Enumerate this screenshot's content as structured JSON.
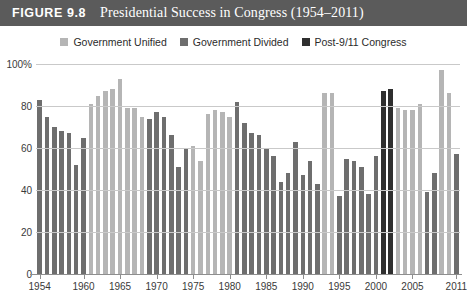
{
  "figure": {
    "number": "FIGURE 9.8",
    "title": "Presidential Success in Congress (1954–2011)"
  },
  "legend": {
    "position": "top-center",
    "items": [
      {
        "label": "Government Unified",
        "color": "#b5b5b5",
        "key": "unified"
      },
      {
        "label": "Government Divided",
        "color": "#6e6e6e",
        "key": "divided"
      },
      {
        "label": "Post-9/11 Congress",
        "color": "#2f2f2f",
        "key": "post911"
      }
    ]
  },
  "colors": {
    "title_bar": "#5b5b5b",
    "unified": "#b5b5b5",
    "divided": "#6e6e6e",
    "post911": "#2f2f2f",
    "gridline": "#c9c9c9",
    "axis": "#8e8e8e",
    "text": "#3a3a3a"
  },
  "chart_data": {
    "type": "bar",
    "title": "Presidential Success in Congress (1954–2011)",
    "xlabel": "",
    "ylabel": "",
    "ylim": [
      0,
      100
    ],
    "yticks": [
      0,
      20,
      40,
      60,
      80,
      100
    ],
    "ytick_labels": [
      "0",
      "20",
      "40",
      "60",
      "80",
      "100%"
    ],
    "xticks": [
      1954,
      1960,
      1965,
      1970,
      1975,
      1980,
      1985,
      1990,
      1995,
      2000,
      2005,
      2011
    ],
    "xtick_labels": [
      "1954",
      "1960",
      "1965",
      "1970",
      "1975",
      "1980",
      "1985",
      "1990",
      "1995",
      "2000",
      "2005",
      "2011"
    ],
    "grid": true,
    "series": [
      {
        "name": "Government Unified",
        "color": "#b5b5b5"
      },
      {
        "name": "Government Divided",
        "color": "#6e6e6e"
      },
      {
        "name": "Post-9/11 Congress",
        "color": "#2f2f2f"
      }
    ],
    "categories": [
      1954,
      1955,
      1956,
      1957,
      1958,
      1959,
      1960,
      1961,
      1962,
      1963,
      1964,
      1965,
      1966,
      1967,
      1968,
      1969,
      1970,
      1971,
      1972,
      1973,
      1974,
      1975,
      1976,
      1977,
      1978,
      1979,
      1980,
      1981,
      1982,
      1983,
      1984,
      1985,
      1986,
      1987,
      1988,
      1989,
      1990,
      1991,
      1992,
      1993,
      1994,
      1995,
      1996,
      1997,
      1998,
      1999,
      2000,
      2001,
      2002,
      2003,
      2004,
      2005,
      2006,
      2007,
      2008,
      2009,
      2010,
      2011
    ],
    "values": [
      83,
      75,
      70,
      68,
      67,
      52,
      65,
      81,
      85,
      87,
      88,
      93,
      79,
      79,
      75,
      74,
      77,
      75,
      66,
      51,
      60,
      61,
      54,
      76,
      78,
      77,
      75,
      82,
      72,
      67,
      66,
      60,
      56,
      44,
      48,
      63,
      47,
      54,
      43,
      86,
      86,
      37,
      55,
      54,
      51,
      38,
      56,
      87,
      88,
      79,
      78,
      78,
      81,
      39,
      48,
      97,
      86,
      57
    ],
    "government_status": [
      "divided",
      "divided",
      "divided",
      "divided",
      "divided",
      "divided",
      "divided",
      "unified",
      "unified",
      "unified",
      "unified",
      "unified",
      "unified",
      "unified",
      "unified",
      "divided",
      "divided",
      "divided",
      "divided",
      "divided",
      "divided",
      "unified",
      "unified",
      "unified",
      "unified",
      "unified",
      "unified",
      "divided",
      "divided",
      "divided",
      "divided",
      "divided",
      "divided",
      "divided",
      "divided",
      "divided",
      "divided",
      "divided",
      "divided",
      "unified",
      "unified",
      "divided",
      "divided",
      "divided",
      "divided",
      "divided",
      "divided",
      "post911",
      "post911",
      "unified",
      "unified",
      "unified",
      "unified",
      "divided",
      "divided",
      "unified",
      "unified",
      "divided"
    ]
  }
}
